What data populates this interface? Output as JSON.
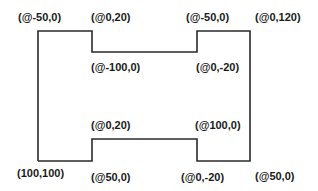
{
  "diagram": {
    "type": "relative-coordinate polyline outline",
    "stroke_color": "#2a2a2a",
    "shape_points": [
      [
        38,
        161
      ],
      [
        38,
        31
      ],
      [
        92,
        31
      ],
      [
        92,
        52
      ],
      [
        197,
        52
      ],
      [
        197,
        31
      ],
      [
        250,
        31
      ],
      [
        250,
        161
      ],
      [
        197,
        161
      ],
      [
        197,
        139
      ],
      [
        92,
        139
      ],
      [
        92,
        161
      ]
    ],
    "labels": [
      {
        "id": "label-start",
        "text": "(100,100)",
        "x": 17,
        "y": 168
      },
      {
        "id": "label-up-left",
        "text": "(@-50,0)",
        "x": 18,
        "y": 12
      },
      {
        "id": "label-top-left-step",
        "text": "(@0,20)",
        "x": 91,
        "y": 12
      },
      {
        "id": "label-top-middle",
        "text": "(@-100,0)",
        "x": 91,
        "y": 62
      },
      {
        "id": "label-top-right-step",
        "text": "(@0,-20)",
        "x": 196,
        "y": 62
      },
      {
        "id": "label-top-right",
        "text": "(@-50,0)",
        "x": 186,
        "y": 12
      },
      {
        "id": "label-right-side",
        "text": "(@0,120)",
        "x": 255,
        "y": 12
      },
      {
        "id": "label-bottom-right",
        "text": "(@50,0)",
        "x": 255,
        "y": 171
      },
      {
        "id": "label-bottom-right-step",
        "text": "(@0,-20)",
        "x": 181,
        "y": 172
      },
      {
        "id": "label-bottom-middle",
        "text": "(@100,0)",
        "x": 195,
        "y": 120
      },
      {
        "id": "label-bottom-left-step",
        "text": "(@0,20)",
        "x": 91,
        "y": 120
      },
      {
        "id": "label-bottom-left",
        "text": "(@50,0)",
        "x": 91,
        "y": 172
      }
    ]
  }
}
